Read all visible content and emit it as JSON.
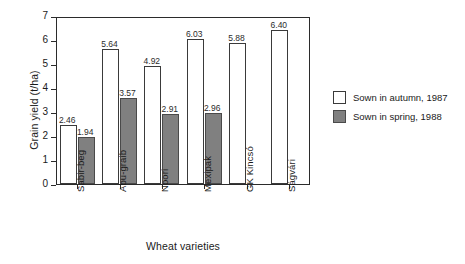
{
  "chart_data": {
    "type": "bar",
    "title": "",
    "xlabel": "Wheat varieties",
    "ylabel": "Grain yield (t/ha)",
    "categories": [
      "Sabir-beg",
      "Abu-graib",
      "Noori",
      "Mexipak",
      "GK Kincsó",
      "Ságvári"
    ],
    "series": [
      {
        "name": "Sown in autumn, 1987",
        "color": "#ffffff",
        "values": [
          2.46,
          5.64,
          4.92,
          6.03,
          5.88,
          6.4
        ],
        "labels": [
          "2.46",
          "5.64",
          "4.92",
          "6.03",
          "5.88",
          "6.40"
        ]
      },
      {
        "name": "Sown in spring, 1988",
        "color": "#808080",
        "values": [
          1.94,
          3.57,
          2.91,
          2.96,
          null,
          null
        ],
        "labels": [
          "1.94",
          "3.57",
          "2.91",
          "2.96",
          "",
          ""
        ]
      }
    ],
    "ylim": [
      0,
      7
    ],
    "yticks": [
      "0",
      "1",
      "2",
      "3",
      "4",
      "5",
      "6",
      "7"
    ],
    "grid": false,
    "legend_position": "right"
  },
  "legend": {
    "items": [
      {
        "label": "Sown in autumn, 1987"
      },
      {
        "label": "Sown in spring, 1988"
      }
    ]
  }
}
